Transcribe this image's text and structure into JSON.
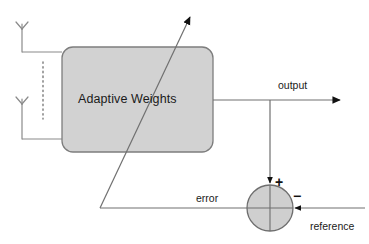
{
  "diagram": {
    "block": {
      "label": "Adaptive Weights",
      "fill_color": "#d0d0d0",
      "stroke_color": "#7a7a7a"
    },
    "labels": {
      "output": "output",
      "error": "error",
      "reference": "reference",
      "plus_sign": "+",
      "minus_sign": "−"
    },
    "summing_junction": {
      "fill_color": "#cccccc",
      "stroke_color": "#6e6e6e"
    },
    "antennas": [
      {
        "name": "antenna-top"
      },
      {
        "name": "antenna-bottom"
      }
    ],
    "line_color": "#707070",
    "arrow_color": "#111111",
    "vertical_dots_color": "#8a8a8a"
  }
}
